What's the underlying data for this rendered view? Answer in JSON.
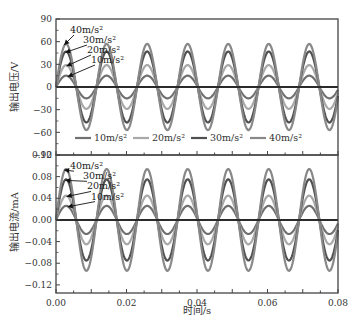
{
  "chart_data": [
    {
      "type": "line",
      "panel": "top",
      "ylabel": "输出电压/V",
      "xlabel": "",
      "xlim": [
        0,
        0.08
      ],
      "ylim": [
        -90,
        90
      ],
      "yticks": [
        -90,
        -60,
        -30,
        0,
        30,
        60,
        90
      ],
      "ytick_labels": [
        "−90",
        "−60",
        "−30",
        "0",
        "30",
        "60",
        "90"
      ],
      "grid": false,
      "legend_position": "lower center (inside)",
      "frequency_hz": 87,
      "waveform": "sine",
      "series": [
        {
          "name": "10m/s²",
          "amplitude": 15,
          "color": "#707070"
        },
        {
          "name": "20m/s²",
          "amplitude": 29,
          "color": "#a8a8a8"
        },
        {
          "name": "30m/s²",
          "amplitude": 47,
          "color": "#505050"
        },
        {
          "name": "40m/s²",
          "amplitude": 57,
          "color": "#888888"
        }
      ],
      "annotations": [
        "40m/s²",
        "30m/s²",
        "20m/s²",
        "10m/s²"
      ]
    },
    {
      "type": "line",
      "panel": "bottom",
      "ylabel": "输出电流/mA",
      "xlabel": "时间/s",
      "xlim": [
        0,
        0.08
      ],
      "ylim": [
        -0.135,
        0.12
      ],
      "yticks": [
        -0.12,
        -0.08,
        -0.04,
        0.0,
        0.04,
        0.08,
        0.12
      ],
      "ytick_labels": [
        "−0.12",
        "−0.08",
        "−0.04",
        "0.00",
        "0.04",
        "0.08",
        "0.12"
      ],
      "xticks": [
        0.0,
        0.02,
        0.04,
        0.06,
        0.08
      ],
      "xtick_labels": [
        "0.00",
        "0.02",
        "0.04",
        "0.06",
        "0.08"
      ],
      "grid": false,
      "frequency_hz": 87,
      "waveform": "sine",
      "series": [
        {
          "name": "10m/s²",
          "amplitude": 0.026,
          "color": "#707070"
        },
        {
          "name": "20m/s²",
          "amplitude": 0.045,
          "color": "#a8a8a8"
        },
        {
          "name": "30m/s²",
          "amplitude": 0.075,
          "color": "#505050"
        },
        {
          "name": "40m/s²",
          "amplitude": 0.094,
          "color": "#888888"
        }
      ],
      "annotations": [
        "40m/s²",
        "30m/s²",
        "20m/s²",
        "10m/s²"
      ]
    }
  ],
  "legend": {
    "items": [
      "10m/s²",
      "20m/s²",
      "30m/s²",
      "40m/s²"
    ]
  },
  "layout": {
    "plot_left": 56,
    "plot_right": 338,
    "top_panel": {
      "y_top": 19,
      "y_bottom": 155
    },
    "bottom_panel": {
      "y_top": 155,
      "y_bottom": 293
    }
  }
}
